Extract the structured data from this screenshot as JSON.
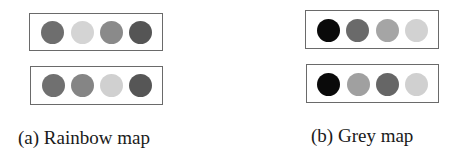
{
  "panels": [
    {
      "id": "a",
      "caption": "(a) Rainbow map",
      "rows": [
        {
          "colors": [
            "#6e6e6e",
            "#d4d4d4",
            "#8a8a8a",
            "#555555"
          ]
        },
        {
          "colors": [
            "#707070",
            "#858585",
            "#d0d0d0",
            "#565656"
          ]
        }
      ]
    },
    {
      "id": "b",
      "caption": "(b) Grey map",
      "rows": [
        {
          "colors": [
            "#0a0a0a",
            "#6a6a6a",
            "#a5a5a5",
            "#d2d2d2"
          ]
        },
        {
          "colors": [
            "#0a0a0a",
            "#a0a0a0",
            "#666666",
            "#d0d0d0"
          ]
        }
      ]
    }
  ],
  "colors": {
    "box_border": "#6a6a6a",
    "caption_text": "#1a1a1a",
    "background": "#ffffff"
  }
}
